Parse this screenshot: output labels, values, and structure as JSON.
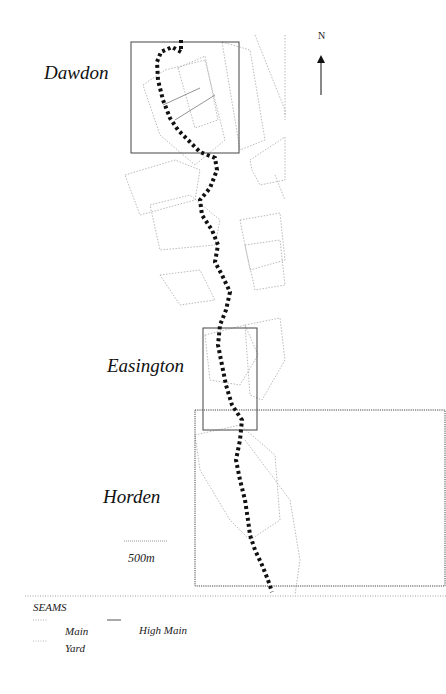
{
  "map": {
    "north_label": "N",
    "places": [
      {
        "name": "Dawdon"
      },
      {
        "name": "Easington"
      },
      {
        "name": "Horden"
      }
    ],
    "scale_bar_label": "500m",
    "colors": {
      "route": "#111111",
      "box": "#444444",
      "seam_main": "#9a9a9a",
      "seam_yard": "#b5b5b5",
      "seam_high_main": "#555555"
    }
  },
  "legend": {
    "title": "SEAMS",
    "items": [
      {
        "label": "Main",
        "style": "dotted"
      },
      {
        "label": "High Main",
        "style": "solid"
      },
      {
        "label": "Yard",
        "style": "dotted-fine"
      }
    ]
  }
}
